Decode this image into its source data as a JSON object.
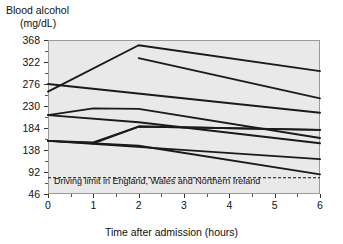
{
  "chart_data": {
    "type": "line",
    "title": "",
    "ylabel": "Blood alcohol (mg/dL)",
    "ylabel_lines": [
      "Blood alcohol",
      "(mg/dL)"
    ],
    "xlabel": "Time after admission (hours)",
    "xlim": [
      0,
      6
    ],
    "ylim": [
      46,
      368
    ],
    "yticks": [
      368,
      322,
      276,
      230,
      184,
      138,
      92,
      46
    ],
    "xticks": [
      0,
      1,
      2,
      3,
      4,
      5,
      6
    ],
    "ytick_labels": [
      "368",
      "322",
      "276",
      "230",
      "184",
      "138",
      "92",
      "46"
    ],
    "xtick_labels": [
      "0",
      "1",
      "2",
      "3",
      "4",
      "5",
      "6"
    ],
    "grid": false,
    "legend": "none",
    "plot_background": "#e9e9e9",
    "line_color": "#1a1a1a",
    "annotations": [
      {
        "text": "Driving limit in England, Wales and Northern Ireland",
        "value": 80,
        "style": "dashed-horizontal-line"
      }
    ],
    "series": [
      {
        "name": "patient-1",
        "x": [
          0,
          2,
          6
        ],
        "values": [
          260,
          357,
          303
        ]
      },
      {
        "name": "patient-2",
        "x": [
          2,
          6
        ],
        "values": [
          330,
          246
        ]
      },
      {
        "name": "patient-3",
        "x": [
          0,
          6
        ],
        "values": [
          276,
          216
        ]
      },
      {
        "name": "patient-4",
        "x": [
          0,
          1,
          2,
          6
        ],
        "values": [
          211,
          225,
          224,
          163
        ]
      },
      {
        "name": "patient-5",
        "x": [
          0,
          2,
          6
        ],
        "values": [
          211,
          196,
          152
        ]
      },
      {
        "name": "patient-6",
        "x": [
          0,
          6
        ],
        "values": [
          157,
          119
        ]
      },
      {
        "name": "patient-7",
        "x": [
          0,
          1,
          2,
          6
        ],
        "values": [
          157,
          154,
          187,
          180
        ]
      },
      {
        "name": "patient-8",
        "x": [
          1,
          2,
          6
        ],
        "values": [
          152,
          187,
          180
        ]
      },
      {
        "name": "patient-9",
        "x": [
          0,
          2,
          6
        ],
        "values": [
          157,
          147,
          87
        ]
      }
    ]
  },
  "axes": {
    "y_label_top": "Blood alcohol",
    "y_label_units": "(mg/dL)",
    "x_label": "Time after admission (hours)"
  },
  "annotation": {
    "driving_limit_text": "Driving limit in England, Wales and Northern Ireland"
  }
}
